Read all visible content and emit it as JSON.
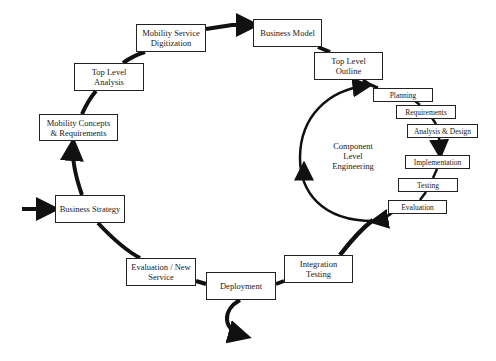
{
  "diagram": {
    "title": "",
    "outer_cycle": [
      {
        "id": "business-strategy",
        "label": "Business Strategy"
      },
      {
        "id": "mobility-concepts",
        "label": "Mobility Concepts & Requirements"
      },
      {
        "id": "top-level-analysis",
        "label": "Top Level Analysis"
      },
      {
        "id": "mobility-service-digitization",
        "label": "Mobility Service Digitization"
      },
      {
        "id": "business-model",
        "label": "Business Model"
      },
      {
        "id": "top-level-outline",
        "label": "Top Level Outline"
      },
      {
        "id": "integration-testing",
        "label": "Integration Testing"
      },
      {
        "id": "deployment",
        "label": "Deployment"
      },
      {
        "id": "evaluation-new-service",
        "label": "Evaluation / New Service"
      }
    ],
    "inner_cycle": {
      "label": "Component Level Engineering",
      "steps": [
        {
          "id": "planning",
          "label": "Planning"
        },
        {
          "id": "requirements",
          "label": "Requirements"
        },
        {
          "id": "analysis-design",
          "label": "Analysis & Design"
        },
        {
          "id": "implementation",
          "label": "Implementation"
        },
        {
          "id": "testing",
          "label": "Testing"
        },
        {
          "id": "evaluation",
          "label": "Evaluation"
        }
      ]
    },
    "boxes": {
      "mobility_service_line1": "Mobility Service",
      "mobility_service_line2": "Digitization",
      "business_model": "Business Model",
      "top_level_outline_line1": "Top Level",
      "top_level_outline_line2": "Outline",
      "top_level_analysis_line1": "Top Level",
      "top_level_analysis_line2": "Analysis",
      "mobility_concepts_line1": "Mobility Concepts",
      "mobility_concepts_line2": "& Requirements",
      "business_strategy": "Business Strategy",
      "evaluation_new_line1": "Evaluation / New",
      "evaluation_new_line2": "Service",
      "deployment": "Deployment",
      "integration_testing_line1": "Integration",
      "integration_testing_line2": "Testing",
      "planning": "Planning",
      "requirements": "Requirements",
      "analysis_design": "Analysis & Design",
      "implementation": "Implementation",
      "testing": "Testing",
      "evaluation": "Evaluation",
      "component_line1": "Component",
      "component_line2": "Level",
      "component_line3": "Engineering"
    },
    "colors": {
      "line": "#111111",
      "box_border": "#222222",
      "background": "#ffffff"
    }
  }
}
